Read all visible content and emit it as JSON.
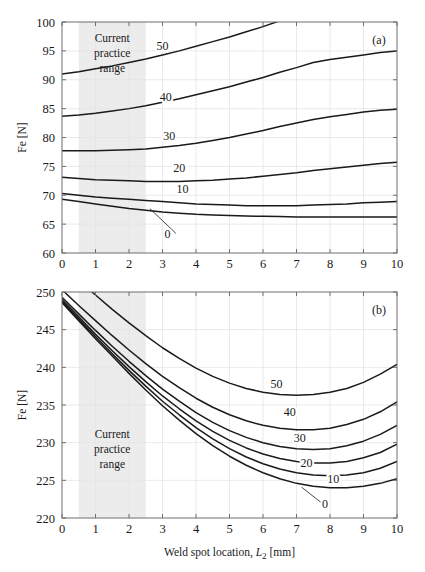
{
  "figure": {
    "panels": [
      {
        "id": "a",
        "panel_label": "(a)",
        "annotation": {
          "line1": "Current",
          "line2": "practice",
          "line3": "range"
        }
      },
      {
        "id": "b",
        "panel_label": "(b)",
        "annotation": {
          "line1": "Current",
          "line2": "practice",
          "line3": "range"
        }
      }
    ],
    "axis_titles": {
      "y": "Fe [N]",
      "y_main": "Fe",
      "y_unit": "[N]",
      "x_main": "Weld spot location,",
      "x_symbol": "L",
      "x_subscript": "2",
      "x_unit": "[mm]",
      "x_full": "Weld spot location, L2 [mm]"
    },
    "shaded_band": {
      "label": "Current practice range",
      "x_start": 0.5,
      "x_end": 2.5,
      "color": "#ececed"
    },
    "colors": {
      "curve": "#1a1a1a",
      "grid": "#e4e4e6",
      "axis": "#6f6f72",
      "background": "#ffffff"
    }
  },
  "chart_data": [
    {
      "type": "line",
      "panel": "a",
      "title": "(a)",
      "xlabel": "Weld spot location, L2 [mm]",
      "ylabel": "Fe [N]",
      "xlim": [
        0,
        10
      ],
      "ylim": [
        60,
        100
      ],
      "xticks": [
        0,
        1,
        2,
        3,
        4,
        5,
        6,
        7,
        8,
        9,
        10
      ],
      "yticks": [
        60,
        65,
        70,
        75,
        80,
        85,
        90,
        95,
        100
      ],
      "grid": true,
      "legend": "inline-curve-labels",
      "x": [
        0,
        0.5,
        1,
        1.5,
        2,
        2.5,
        3,
        3.5,
        4,
        4.5,
        5,
        5.5,
        6,
        6.5,
        7,
        7.5,
        8,
        8.5,
        9,
        9.5,
        10
      ],
      "series": [
        {
          "name": "50",
          "label": "50",
          "label_x": 3.0,
          "label_y": 95.2,
          "values": [
            91.0,
            91.4,
            91.9,
            92.4,
            93.0,
            93.6,
            94.3,
            95.0,
            95.8,
            96.6,
            97.4,
            98.3,
            99.2,
            100.2,
            101.2,
            102.2,
            null,
            null,
            null,
            null,
            null
          ]
        },
        {
          "name": "40",
          "label": "40",
          "label_x": 3.1,
          "label_y": 86.4,
          "values": [
            83.7,
            83.9,
            84.2,
            84.6,
            85.0,
            85.5,
            86.1,
            86.7,
            87.4,
            88.1,
            88.8,
            89.6,
            90.4,
            91.3,
            92.1,
            93.0,
            93.5,
            93.9,
            94.3,
            94.7,
            95.0
          ]
        },
        {
          "name": "30",
          "label": "30",
          "label_x": 3.2,
          "label_y": 79.6,
          "values": [
            77.7,
            77.7,
            77.7,
            77.8,
            77.9,
            78.0,
            78.3,
            78.6,
            79.0,
            79.5,
            80.0,
            80.6,
            81.2,
            81.9,
            82.5,
            83.1,
            83.6,
            84.0,
            84.4,
            84.7,
            84.9
          ]
        },
        {
          "name": "20",
          "label": "20",
          "label_x": 3.5,
          "label_y": 74.0,
          "values": [
            73.1,
            72.9,
            72.7,
            72.6,
            72.5,
            72.4,
            72.4,
            72.4,
            72.5,
            72.6,
            72.8,
            73.0,
            73.3,
            73.6,
            73.9,
            74.3,
            74.6,
            74.9,
            75.2,
            75.5,
            75.7
          ]
        },
        {
          "name": "10",
          "label": "10",
          "label_x": 3.6,
          "label_y": 70.4,
          "values": [
            70.3,
            70.0,
            69.7,
            69.5,
            69.3,
            69.1,
            68.9,
            68.7,
            68.5,
            68.4,
            68.3,
            68.2,
            68.2,
            68.2,
            68.2,
            68.3,
            68.4,
            68.5,
            68.7,
            68.8,
            68.9
          ]
        },
        {
          "name": "0",
          "label": "0",
          "label_x": 3.15,
          "label_y": 62.6,
          "leader_from": [
            3.4,
            63.4
          ],
          "leader_to": [
            2.62,
            67.7
          ],
          "values": [
            69.3,
            68.9,
            68.5,
            68.1,
            67.7,
            67.4,
            67.1,
            66.9,
            66.7,
            66.6,
            66.5,
            66.4,
            66.35,
            66.3,
            66.25,
            66.25,
            66.25,
            66.25,
            66.25,
            66.25,
            66.25
          ]
        }
      ]
    },
    {
      "type": "line",
      "panel": "b",
      "title": "(b)",
      "xlabel": "Weld spot location, L2 [mm]",
      "ylabel": "Fe [N]",
      "xlim": [
        0,
        10
      ],
      "ylim": [
        220,
        250
      ],
      "xticks": [
        0,
        1,
        2,
        3,
        4,
        5,
        6,
        7,
        8,
        9,
        10
      ],
      "yticks": [
        220,
        225,
        230,
        235,
        240,
        245,
        250
      ],
      "grid": true,
      "legend": "inline-curve-labels",
      "x": [
        0,
        0.5,
        1,
        1.5,
        2,
        2.5,
        3,
        3.5,
        4,
        4.5,
        5,
        5.5,
        6,
        6.5,
        7,
        7.5,
        8,
        8.5,
        9,
        9.5,
        10
      ],
      "series": [
        {
          "name": "50",
          "label": "50",
          "label_x": 6.4,
          "label_y": 237.3,
          "values": [
            253.5,
            251.5,
            249.6,
            247.7,
            245.9,
            244.2,
            242.6,
            241.2,
            239.9,
            238.8,
            237.9,
            237.2,
            236.7,
            236.4,
            236.3,
            236.4,
            236.7,
            237.2,
            238.0,
            239.1,
            240.4
          ]
        },
        {
          "name": "40",
          "label": "40",
          "label_x": 6.8,
          "label_y": 233.5,
          "values": [
            250.3,
            248.2,
            246.2,
            244.2,
            242.3,
            240.5,
            238.8,
            237.3,
            235.9,
            234.7,
            233.7,
            232.9,
            232.3,
            231.9,
            231.7,
            231.7,
            231.9,
            232.4,
            233.1,
            234.1,
            235.4
          ]
        },
        {
          "name": "30",
          "label": "30",
          "label_x": 7.1,
          "label_y": 230.1,
          "values": [
            249.3,
            247.1,
            244.9,
            242.8,
            240.8,
            238.9,
            237.1,
            235.5,
            234.0,
            232.7,
            231.6,
            230.7,
            230.0,
            229.5,
            229.2,
            229.1,
            229.2,
            229.6,
            230.2,
            231.1,
            232.3
          ]
        },
        {
          "name": "20",
          "label": "20",
          "label_x": 7.3,
          "label_y": 226.8,
          "values": [
            249.0,
            246.7,
            244.4,
            242.2,
            240.1,
            238.1,
            236.2,
            234.5,
            232.9,
            231.5,
            230.3,
            229.3,
            228.5,
            227.9,
            227.5,
            227.3,
            227.3,
            227.5,
            228.0,
            228.7,
            229.8
          ]
        },
        {
          "name": "10",
          "label": "10",
          "label_x": 8.1,
          "label_y": 224.7,
          "values": [
            248.8,
            246.4,
            244.1,
            241.8,
            239.6,
            237.5,
            235.5,
            233.7,
            232.0,
            230.5,
            229.2,
            228.1,
            227.2,
            226.5,
            226.0,
            225.7,
            225.6,
            225.7,
            226.0,
            226.6,
            227.5
          ]
        },
        {
          "name": "0",
          "label": "0",
          "label_x": 7.85,
          "label_y": 221.3,
          "leader_from": [
            7.75,
            222.0
          ],
          "leader_to": [
            7.15,
            224.1
          ],
          "values": [
            248.6,
            246.2,
            243.8,
            241.5,
            239.2,
            237.0,
            234.9,
            233.0,
            231.2,
            229.6,
            228.2,
            227.0,
            226.0,
            225.2,
            224.6,
            224.2,
            224.0,
            224.0,
            224.2,
            224.6,
            225.2
          ]
        }
      ]
    }
  ]
}
